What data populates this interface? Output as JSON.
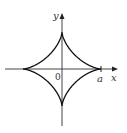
{
  "diagram": {
    "title": "",
    "curve": "astroid",
    "labels": {
      "y_axis": "y",
      "x_axis": "x",
      "origin": "0",
      "a_mark": "a"
    },
    "colors": {
      "curve": "#111111",
      "axis": "#444444"
    }
  }
}
